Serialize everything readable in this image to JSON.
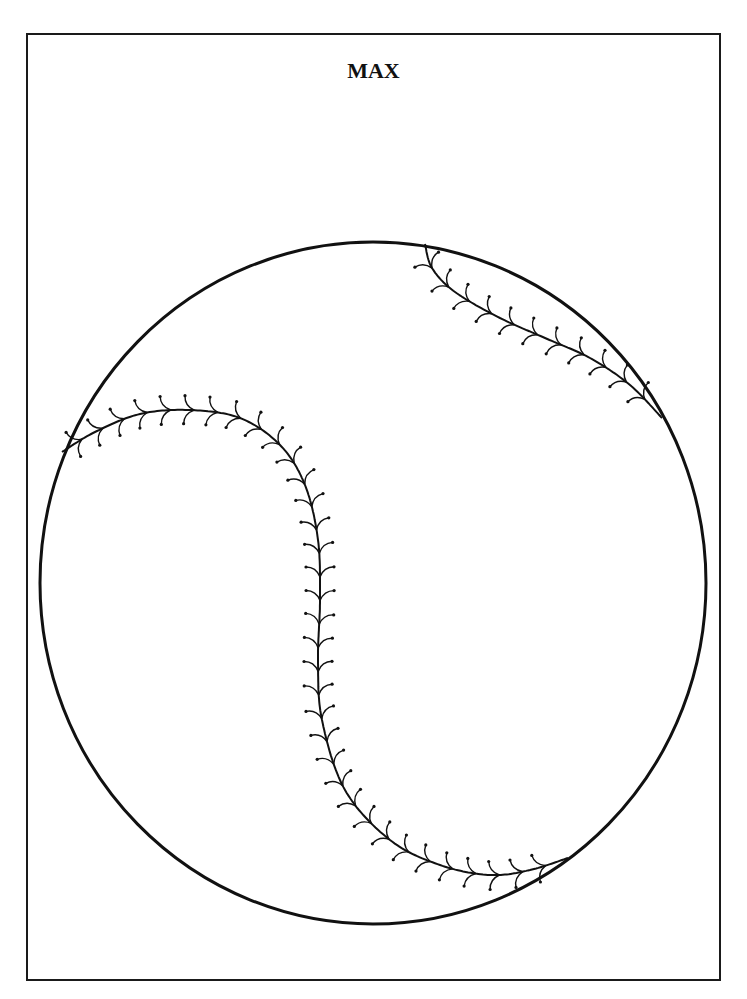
{
  "page": {
    "title": "MAX",
    "colors": {
      "ink": "#111111",
      "background": "#ffffff"
    }
  },
  "ball": {
    "cx": 373,
    "cy": 583,
    "rx": 333,
    "ry": 341,
    "seams": [
      {
        "name": "top-right-seam",
        "points": [
          [
            425,
            244
          ],
          [
            432,
            268
          ],
          [
            455,
            292
          ],
          [
            500,
            318
          ],
          [
            545,
            338
          ],
          [
            590,
            358
          ],
          [
            630,
            385
          ],
          [
            662,
            418
          ]
        ],
        "stitches": 12
      },
      {
        "name": "left-seam",
        "points": [
          [
            62,
            452
          ],
          [
            95,
            432
          ],
          [
            140,
            414
          ],
          [
            190,
            410
          ],
          [
            240,
            418
          ],
          [
            280,
            445
          ],
          [
            305,
            485
          ],
          [
            318,
            540
          ],
          [
            320,
            600
          ],
          [
            318,
            660
          ],
          [
            322,
            720
          ],
          [
            345,
            790
          ],
          [
            390,
            840
          ],
          [
            440,
            865
          ],
          [
            490,
            875
          ],
          [
            530,
            870
          ],
          [
            568,
            858
          ]
        ],
        "stitches": 36
      }
    ]
  }
}
